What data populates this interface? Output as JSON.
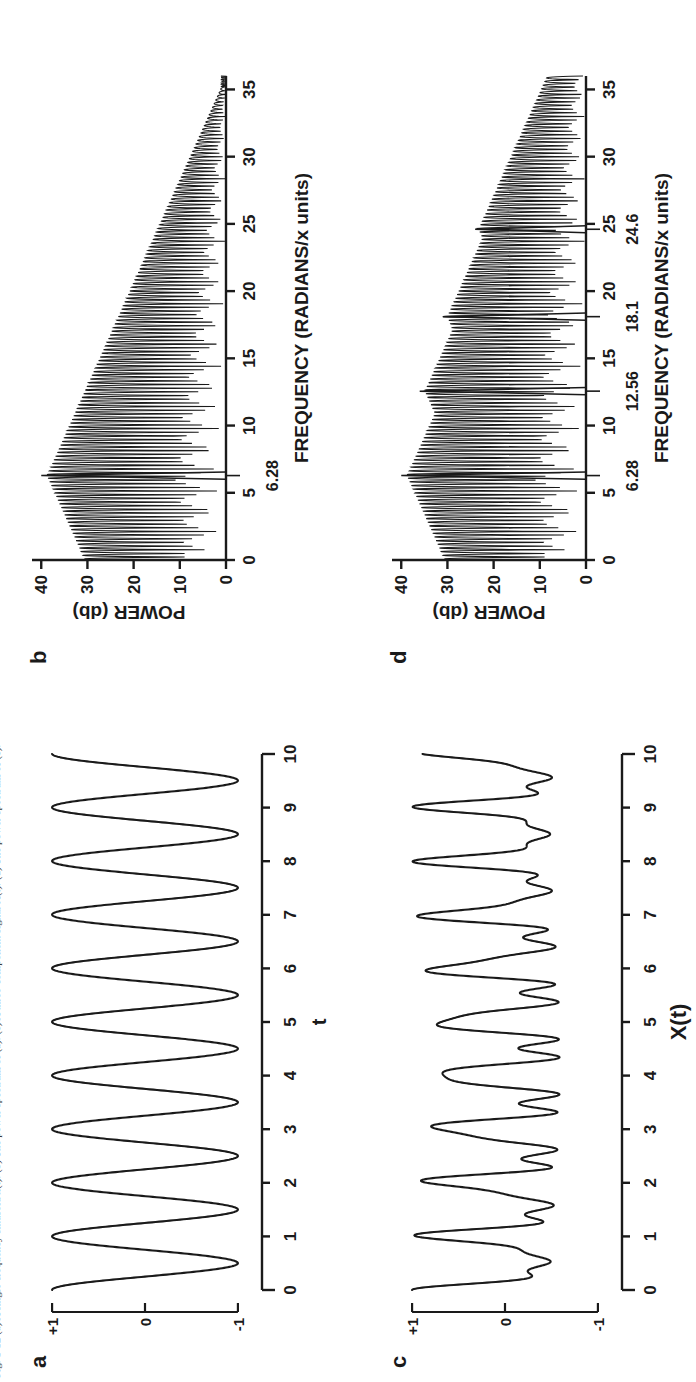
{
  "figure": {
    "caption": "Fig. 1-12  (a) A single-frequency sinusoid x(t). (b) The power spectrum of (a). (c) A three-component signal X(t). (d) The power spectrum of (c).",
    "orientation": "rotated-90-ccw",
    "ink_color": "#1a1a1a",
    "background_color": "#ffffff"
  },
  "panels": [
    {
      "id": "a",
      "letter": "a",
      "type": "waveform"
    },
    {
      "id": "b",
      "letter": "b",
      "type": "spectrum"
    },
    {
      "id": "c",
      "letter": "c",
      "type": "waveform"
    },
    {
      "id": "d",
      "letter": "d",
      "type": "spectrum"
    }
  ],
  "chart_data": [
    {
      "panel": "a",
      "type": "line",
      "title": "",
      "xlabel": "t",
      "ylabel": "",
      "xlim": [
        0,
        10
      ],
      "ylim": [
        -1,
        1
      ],
      "xticks": [
        0,
        1,
        2,
        3,
        4,
        5,
        6,
        7,
        8,
        9,
        10
      ],
      "xtick_labels": [
        "0",
        "1",
        "2",
        "3",
        "4",
        "5",
        "6",
        "7",
        "8",
        "9",
        "10"
      ],
      "yticks": [
        1,
        0,
        -1
      ],
      "ytick_labels": [
        "+1",
        "0",
        "-1"
      ],
      "grid": false,
      "legend": "none",
      "description": "single sinusoid, unit amplitude, frequency 6.28 radians per x unit (one cycle per unit t)",
      "components": [
        {
          "amplitude": 1.0,
          "frequency_rad": 6.28,
          "phase": 0
        }
      ]
    },
    {
      "panel": "b",
      "type": "line",
      "title": "",
      "xlabel": "FREQUENCY (RADIANS/x units)",
      "ylabel": "POWER (db)",
      "xlim": [
        0,
        36
      ],
      "ylim": [
        0,
        42
      ],
      "xticks": [
        0,
        5,
        10,
        15,
        20,
        25,
        30,
        35
      ],
      "xtick_labels": [
        "0",
        "5",
        "10",
        "15",
        "20",
        "25",
        "30",
        "35"
      ],
      "yticks": [
        0,
        10,
        20,
        30,
        40
      ],
      "ytick_labels": [
        "0",
        "10",
        "20",
        "30",
        "40"
      ],
      "annotations": [
        {
          "text": "6.28",
          "x": 6.28,
          "kind": "frequency-marker"
        }
      ],
      "grid": false,
      "legend": "none",
      "description": "power spectrum of (a): one dominant spectral peak at 6.28 rad/unit reaching about 40 db, with a decaying sidelobe skirt extending to roughly 17 rad/unit",
      "peaks": [
        {
          "frequency_rad": 6.28,
          "power_db": 40
        }
      ],
      "noise_floor_db": 12
    },
    {
      "panel": "c",
      "type": "line",
      "title": "",
      "xlabel": "X(t)",
      "ylabel": "",
      "xlim": [
        0,
        10
      ],
      "ylim": [
        -1,
        1
      ],
      "xticks": [
        0,
        1,
        2,
        3,
        4,
        5,
        6,
        7,
        8,
        9,
        10
      ],
      "xtick_labels": [
        "0",
        "1",
        "2",
        "3",
        "4",
        "5",
        "6",
        "7",
        "8",
        "9",
        "10"
      ],
      "yticks": [
        1,
        0,
        -1
      ],
      "ytick_labels": [
        "+1",
        "0",
        "-1"
      ],
      "grid": false,
      "legend": "none",
      "description": "sum of three sinusoids at 6.28, 12.56 and 18.1 radians per x unit producing a repeating composite waveform",
      "components": [
        {
          "amplitude": 1.0,
          "frequency_rad": 6.28,
          "phase": 0
        },
        {
          "amplitude": 0.45,
          "frequency_rad": 12.56,
          "phase": 0
        },
        {
          "amplitude": 0.3,
          "frequency_rad": 18.1,
          "phase": 0
        }
      ]
    },
    {
      "panel": "d",
      "type": "line",
      "title": "",
      "xlabel": "FREQUENCY (RADIANS/x units)",
      "ylabel": "POWER (db)",
      "xlim": [
        0,
        36
      ],
      "ylim": [
        0,
        42
      ],
      "xticks": [
        0,
        5,
        10,
        15,
        20,
        25,
        30,
        35
      ],
      "xtick_labels": [
        "0",
        "5",
        "10",
        "15",
        "20",
        "25",
        "30",
        "35"
      ],
      "yticks": [
        0,
        10,
        20,
        30,
        40
      ],
      "ytick_labels": [
        "0",
        "10",
        "20",
        "30",
        "40"
      ],
      "annotations": [
        {
          "text": "6.28",
          "x": 6.28,
          "kind": "frequency-marker"
        },
        {
          "text": "12.56",
          "x": 12.56,
          "kind": "frequency-marker"
        },
        {
          "text": "18.1",
          "x": 18.1,
          "kind": "frequency-marker"
        },
        {
          "text": "24.6",
          "x": 24.6,
          "kind": "frequency-marker"
        }
      ],
      "grid": false,
      "legend": "none",
      "description": "power spectrum of (c): four spectral peaks at 6.28, 12.56, 18.1 and 24.6 rad/unit with decreasing power, each surrounded by dense sidelobes",
      "peaks": [
        {
          "frequency_rad": 6.28,
          "power_db": 40
        },
        {
          "frequency_rad": 12.56,
          "power_db": 36
        },
        {
          "frequency_rad": 18.1,
          "power_db": 31
        },
        {
          "frequency_rad": 24.6,
          "power_db": 24
        }
      ],
      "noise_floor_db": 12
    }
  ]
}
